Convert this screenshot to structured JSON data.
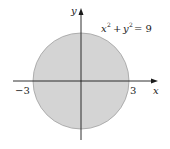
{
  "diagram": {
    "equation": {
      "base_x": "x",
      "exp_x": "2",
      "plus": "+",
      "base_y": "y",
      "exp_y": "2",
      "rhs": "= 9"
    },
    "axis_labels": {
      "x": "x",
      "y": "y"
    },
    "ticks": {
      "neg": "−3",
      "pos": "3"
    },
    "colors": {
      "fill": "#d4d4d4",
      "stroke": "#9a9a9a",
      "axis": "#1a1a1a"
    }
  }
}
